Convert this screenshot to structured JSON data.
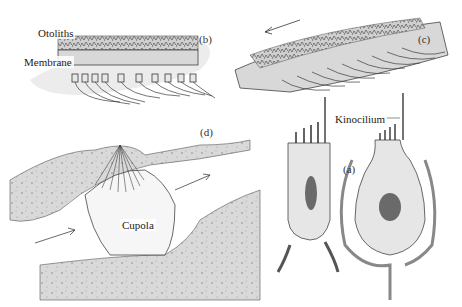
{
  "figure": {
    "panels": [
      {
        "id": "a",
        "label": "(a)",
        "description": "Two vestibular hair cells (type II cylindrical and type I flask-shaped) with stereocilia and kinocilium"
      },
      {
        "id": "b",
        "label": "(b)",
        "description": "Otolith organ at rest: otoliths on membrane over hair cells"
      },
      {
        "id": "c",
        "label": "(c)",
        "description": "Otolith organ tilted; otolithic membrane shifts, bending hair cells"
      },
      {
        "id": "d",
        "label": "(d)",
        "description": "Semicircular canal ampulla with cupola deflected by endolymph flow"
      }
    ],
    "labels": {
      "otoliths": "Otoliths",
      "membrane": "Membrane",
      "kinocilium": "Kinocilium",
      "cupola": "Cupola"
    },
    "colors": {
      "stroke": "#3a3a3a",
      "shade": "#b8b8b8",
      "light_shade": "#dcdcdc",
      "nucleus": "#6a6a6a",
      "background": "#ffffff"
    }
  }
}
